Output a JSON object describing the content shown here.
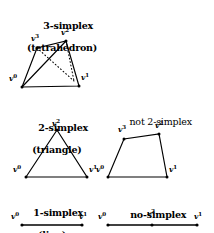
{
  "figure": {
    "title_absent": true,
    "background_color": "#ffffff",
    "ink_color": "#000000"
  },
  "panels": [
    {
      "id": "three-simplex",
      "caption_line1": "3-simplex",
      "caption_line2": "(tetrahedron)",
      "shape": "tetrahedron",
      "vertices": [
        {
          "label": "v",
          "index": "0"
        },
        {
          "label": "v",
          "index": "1"
        },
        {
          "label": "v",
          "index": "2"
        },
        {
          "label": "v",
          "index": "3"
        }
      ]
    },
    {
      "id": "two-simplex",
      "caption_line1": "2-simplex",
      "caption_line2": "(triangle)",
      "shape": "triangle",
      "vertices": [
        {
          "label": "v",
          "index": "0"
        },
        {
          "label": "v",
          "index": "1"
        },
        {
          "label": "v",
          "index": "2"
        }
      ]
    },
    {
      "id": "not-two-simplex",
      "caption_line1": "not 2-simplex",
      "caption_line2": "",
      "shape": "quadrilateral",
      "vertices": [
        {
          "label": "v",
          "index": "0"
        },
        {
          "label": "v",
          "index": "1"
        },
        {
          "label": "v",
          "index": "2"
        },
        {
          "label": "v",
          "index": "3"
        }
      ]
    },
    {
      "id": "one-simplex",
      "caption_line1": "1-simplex",
      "caption_line2": "(line)",
      "shape": "segment",
      "vertices": [
        {
          "label": "v",
          "index": "0"
        },
        {
          "label": "v",
          "index": "1"
        }
      ]
    },
    {
      "id": "no-simplex",
      "caption_line1": "no-simplex",
      "caption_line2": "",
      "shape": "collinear-segment",
      "vertices": [
        {
          "label": "v",
          "index": "0"
        },
        {
          "label": "v",
          "index": "2"
        },
        {
          "label": "v",
          "index": "1"
        }
      ]
    }
  ]
}
